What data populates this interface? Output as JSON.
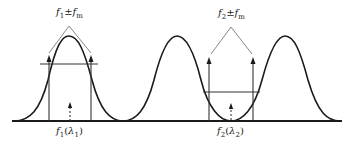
{
  "diagram": {
    "title": "",
    "labels": {
      "top_left": "f1±fm",
      "top_right": "f2±fm",
      "bottom_left": "f1(λ1)",
      "bottom_right": "f2(λ2)"
    },
    "label_parts": {
      "top_left": {
        "f": "f",
        "sub1": "1",
        "pm": "±",
        "f2": "f",
        "sub2": "m"
      },
      "top_right": {
        "f": "f",
        "sub1": "2",
        "pm": "±",
        "f2": "f",
        "sub2": "m"
      },
      "bottom_left": {
        "f": "f",
        "sub1": "1",
        "open": "(",
        "lam": "λ",
        "sub2": "1",
        "close": ")"
      },
      "bottom_right": {
        "f": "f",
        "sub1": "2",
        "open": "(",
        "lam": "λ",
        "sub2": "2",
        "close": ")"
      }
    },
    "colors": {
      "curve": "#1a1a1a",
      "lines": "#333333",
      "bracket": "#888888"
    }
  }
}
